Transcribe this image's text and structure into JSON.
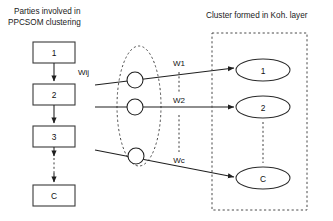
{
  "figure": {
    "title_left": "Parties involved in",
    "title_left_line2": "PPCSOM clustering",
    "title_right": "Cluster formed in Koh. layer"
  },
  "parties": {
    "label": "Parties column",
    "boxes": [
      {
        "label": "1"
      },
      {
        "label": "2"
      },
      {
        "label": "3"
      },
      {
        "label": "C"
      }
    ],
    "chain_weight_label": "Wij"
  },
  "neurons": {
    "label": "Input neuron nodes",
    "count": 3
  },
  "weights": {
    "labels": [
      {
        "label": "W1"
      },
      {
        "label": "W2"
      },
      {
        "label": "Wc"
      }
    ]
  },
  "clusters": {
    "label": "Kohonen layer clusters",
    "nodes": [
      {
        "label": "1"
      },
      {
        "label": "2"
      },
      {
        "label": "C"
      }
    ]
  },
  "colors": {
    "background": "#ffffff",
    "stroke": "#1f1f1f",
    "dashed_stroke": "#4a4a4a",
    "text": "#111111"
  }
}
